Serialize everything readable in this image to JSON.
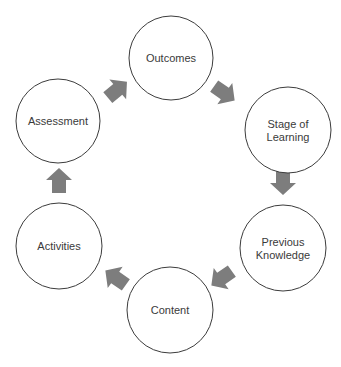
{
  "diagram": {
    "type": "cycle",
    "header_partial_text": "... ing ...",
    "nodes": [
      {
        "id": "outcomes",
        "lines": [
          "Outcomes"
        ],
        "cx": 171,
        "cy": 58,
        "r": 42
      },
      {
        "id": "stage-of-learning",
        "lines": [
          "Stage of",
          "Learning"
        ],
        "cx": 288,
        "cy": 130,
        "r": 43
      },
      {
        "id": "previous-knowledge",
        "lines": [
          "Previous",
          "Knowledge"
        ],
        "cx": 283,
        "cy": 248,
        "r": 43
      },
      {
        "id": "content",
        "lines": [
          "Content"
        ],
        "cx": 170,
        "cy": 310,
        "r": 43
      },
      {
        "id": "activities",
        "lines": [
          "Activities"
        ],
        "cx": 59,
        "cy": 246,
        "r": 43
      },
      {
        "id": "assessment",
        "lines": [
          "Assessment"
        ],
        "cx": 58,
        "cy": 121,
        "r": 42
      }
    ],
    "arrows": [
      {
        "from": "assessment",
        "to": "outcomes",
        "cx": 117,
        "cy": 90,
        "angle": -40
      },
      {
        "from": "outcomes",
        "to": "stage-of-learning",
        "cx": 224,
        "cy": 93,
        "angle": 35
      },
      {
        "from": "stage-of-learning",
        "to": "previous-knowledge",
        "cx": 283,
        "cy": 182,
        "angle": 90
      },
      {
        "from": "previous-knowledge",
        "to": "content",
        "cx": 222,
        "cy": 278,
        "angle": 145
      },
      {
        "from": "content",
        "to": "activities",
        "cx": 116,
        "cy": 278,
        "angle": -145
      },
      {
        "from": "activities",
        "to": "assessment",
        "cx": 59,
        "cy": 181,
        "angle": -90
      }
    ],
    "colors": {
      "circle_stroke": "#3c3c3c",
      "arrow_fill": "#7d7d7d",
      "text": "#3a3a3a"
    }
  }
}
